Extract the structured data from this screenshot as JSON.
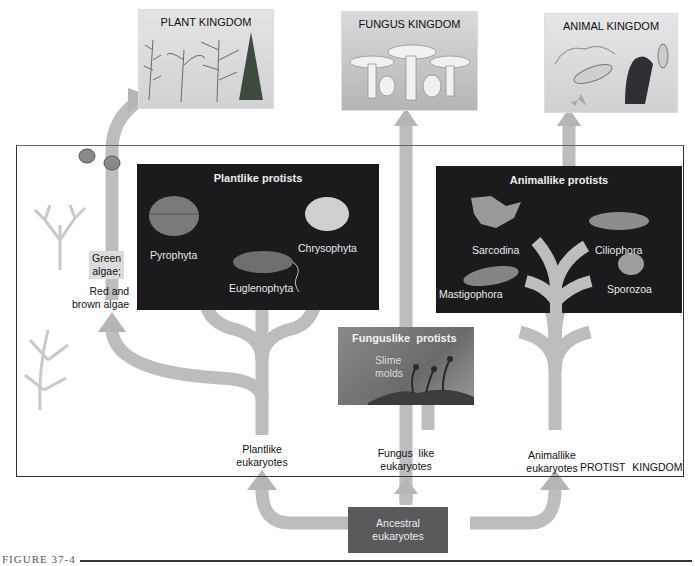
{
  "kingdoms": {
    "plant": {
      "label": "PLANT KINGDOM"
    },
    "fungus": {
      "label": "FUNGUS KINGDOM"
    },
    "animal": {
      "label": "ANIMAL KINGDOM"
    }
  },
  "protist_kingdom": {
    "label": "PROTIST KINGDOM"
  },
  "plantlike_protists": {
    "title": "Plantlike protists",
    "groups": [
      "Pyrophyta",
      "Euglenophyta",
      "Chrysophyta"
    ]
  },
  "animallike_protists": {
    "title": "Animallike protists",
    "groups": [
      "Sarcodina",
      "Ciliophora",
      "Mastigophora",
      "Sporozoa"
    ]
  },
  "funguslike_protists": {
    "title": "Funguslike  protists",
    "group_line1": "Slime",
    "group_line2": "molds"
  },
  "algae": {
    "green_line1": "Green",
    "green_line2": "algae;",
    "red_line1": "Red and",
    "red_line2": "brown algae"
  },
  "eukaryotes": {
    "plantlike_line1": "Plantlike",
    "plantlike_line2": "eukaryotes",
    "funguslike_line1": "Fungus  like",
    "funguslike_line2": "eukaryotes",
    "animallike_line1": "Animallike",
    "animallike_line2": "eukaryotes",
    "ancestral_line1": "Ancestral",
    "ancestral_line2": "eukaryotes"
  },
  "figure": {
    "label": "FIGURE 37-4"
  },
  "colors": {
    "arrow": "#b9b9b9",
    "dark_panel": "#1b1b1d",
    "ancestral_box": "#5a5a5c",
    "fungus_panel": "#8a8a8c"
  }
}
